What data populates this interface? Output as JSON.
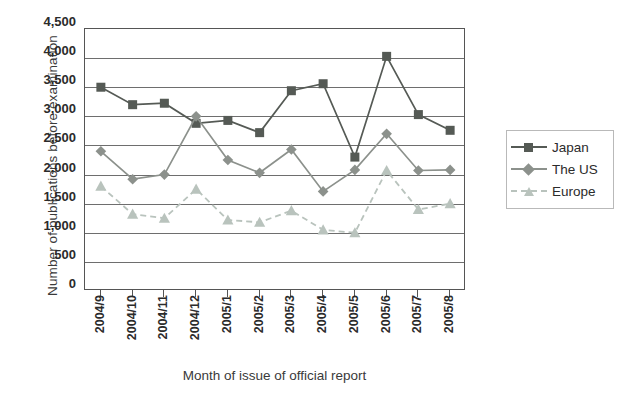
{
  "chart_data": {
    "type": "line",
    "title": "",
    "xlabel": "Month of issue of official report",
    "ylabel": "Number of publications before examination",
    "ylim": [
      0,
      4500
    ],
    "y_ticks": [
      "0",
      "500",
      "1,000",
      "1,500",
      "2,000",
      "2,500",
      "3,000",
      "3,500",
      "4,000",
      "4,500"
    ],
    "y_tick_values": [
      0,
      500,
      1000,
      1500,
      2000,
      2500,
      3000,
      3500,
      4000,
      4500
    ],
    "grid": true,
    "legend_position": "right",
    "categories": [
      "2004/9",
      "2004/10",
      "2004/11",
      "2004/12",
      "2005/1",
      "2005/2",
      "2005/3",
      "2005/4",
      "2005/5",
      "2005/6",
      "2005/7",
      "2005/8"
    ],
    "series": [
      {
        "name": "Japan",
        "color": "#555a55",
        "marker": "square",
        "dashed": false,
        "values": [
          3500,
          3200,
          3225,
          2880,
          2930,
          2720,
          3440,
          3560,
          2300,
          4030,
          3030,
          2760
        ]
      },
      {
        "name": "The US",
        "color": "#8c918c",
        "marker": "diamond",
        "dashed": false,
        "values": [
          2400,
          1920,
          2000,
          3000,
          2250,
          2030,
          2430,
          1710,
          2080,
          2700,
          2070,
          2080
        ]
      },
      {
        "name": "Europe",
        "color": "#b9c3bd",
        "marker": "triangle",
        "dashed": true,
        "values": [
          1800,
          1320,
          1250,
          1750,
          1220,
          1180,
          1380,
          1050,
          1000,
          2070,
          1400,
          1500
        ]
      }
    ]
  },
  "legend": {
    "items": [
      {
        "label": "Japan"
      },
      {
        "label": "The US"
      },
      {
        "label": "Europe"
      }
    ]
  }
}
